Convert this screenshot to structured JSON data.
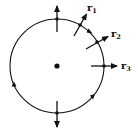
{
  "diagram": {
    "colors": {
      "stroke": "#111111",
      "background": "#ffffff"
    },
    "circle": {
      "cx": 57,
      "cy": 66,
      "r": 47
    },
    "center_dot": {
      "cx": 57,
      "cy": 66,
      "r": 2.6
    },
    "vectors": [
      {
        "name": "top",
        "x1": 57,
        "y1": 32,
        "x2": 57,
        "y2": 6,
        "label": ""
      },
      {
        "name": "r1",
        "x1": 75,
        "y1": 35,
        "x2": 87,
        "y2": 14,
        "label": "r",
        "sub": "1"
      },
      {
        "name": "r2",
        "x1": 87,
        "y1": 49,
        "x2": 108,
        "y2": 37,
        "label": "r",
        "sub": "2"
      },
      {
        "name": "r3",
        "x1": 91,
        "y1": 66,
        "x2": 117,
        "y2": 66,
        "label": "r",
        "sub": "3"
      },
      {
        "name": "bottom",
        "x1": 57,
        "y1": 101,
        "x2": 57,
        "y2": 127,
        "label": ""
      }
    ],
    "labels": {
      "r1": {
        "text": "r",
        "sub": "1"
      },
      "r2": {
        "text": "r",
        "sub": "2"
      },
      "r3": {
        "text": "r",
        "sub": "3"
      }
    },
    "direction": "clockwise"
  }
}
